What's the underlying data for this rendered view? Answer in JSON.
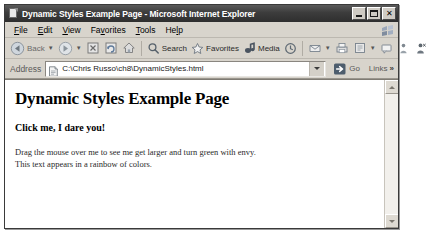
{
  "window": {
    "title": "Dynamic Styles Example Page - Microsoft Internet Explorer",
    "icon": "ie-page-icon",
    "controls": {
      "minimize": "minimize-button",
      "maximize": "maximize-button",
      "close_label": "✕"
    }
  },
  "menubar": {
    "items": [
      {
        "label": "File"
      },
      {
        "label": "Edit"
      },
      {
        "label": "View"
      },
      {
        "label": "Favorites"
      },
      {
        "label": "Tools"
      },
      {
        "label": "Help"
      }
    ]
  },
  "toolbar": {
    "back_label": "Back",
    "search_label": "Search",
    "favorites_label": "Favorites",
    "media_label": "Media",
    "buttons": [
      {
        "name": "back-button",
        "icon": "back-arrow-icon"
      },
      {
        "name": "forward-button",
        "icon": "forward-arrow-icon"
      },
      {
        "name": "stop-button",
        "icon": "stop-icon"
      },
      {
        "name": "refresh-button",
        "icon": "refresh-icon"
      },
      {
        "name": "home-button",
        "icon": "home-icon"
      },
      {
        "name": "search-button",
        "icon": "search-icon"
      },
      {
        "name": "favorites-button",
        "icon": "star-icon"
      },
      {
        "name": "media-button",
        "icon": "media-icon"
      },
      {
        "name": "history-button",
        "icon": "history-icon"
      },
      {
        "name": "mail-button",
        "icon": "mail-icon"
      },
      {
        "name": "print-button",
        "icon": "print-icon"
      },
      {
        "name": "edit-button",
        "icon": "edit-page-icon"
      },
      {
        "name": "discuss-button",
        "icon": "discuss-icon"
      },
      {
        "name": "research-button",
        "icon": "research-icon"
      },
      {
        "name": "messenger-button",
        "icon": "messenger-icon"
      }
    ]
  },
  "addressbar": {
    "label": "Address",
    "value": "C:\\Chris Russo\\ch8\\DynamicStyles.html",
    "go_label": "Go",
    "links_label": "Links",
    "links_chevron": "»"
  },
  "page": {
    "heading": "Dynamic Styles Example Page",
    "subheading": "Click me, I dare you!",
    "line1": "Drag the mouse over me to see me get larger and turn green with envy.",
    "line2": "This text appears in a rainbow of colors."
  },
  "scrollbar": {
    "up": "scroll-up-arrow",
    "down": "scroll-down-arrow"
  },
  "colors": {
    "titlebar": "#3c3c3c",
    "chrome": "#d8d4cc",
    "page_bg": "#ffffff",
    "text": "#000000"
  }
}
